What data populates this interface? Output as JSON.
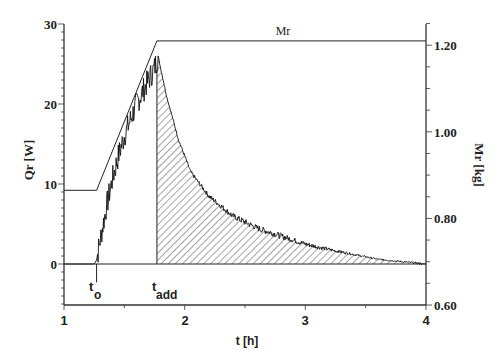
{
  "chart_data": {
    "type": "line",
    "title": "",
    "xlabel": "t [h]",
    "ylabel": "Qr [W]",
    "y2label": "Mr [kg]",
    "xlim": [
      1,
      4
    ],
    "ylim": [
      -5,
      30
    ],
    "y2lim": [
      0.6,
      1.25
    ],
    "x_ticks": [
      "1",
      "2",
      "3",
      "4"
    ],
    "y_ticks": [
      "0",
      "10",
      "20",
      "30"
    ],
    "y2_ticks": [
      "0.60",
      "0.80",
      "1.00",
      "1.20"
    ],
    "grid": false,
    "legend": "none",
    "annotations": [
      {
        "text_main": "t",
        "text_sub": "o",
        "x": 1.27,
        "y": -3.5
      },
      {
        "text_main": "t",
        "text_sub": "add",
        "x": 1.77,
        "y": -3.5
      },
      {
        "text": "Mr",
        "x": 2.75,
        "y2": 1.23
      }
    ],
    "series": [
      {
        "name": "Mr",
        "axis": "right",
        "x": [
          1.0,
          1.27,
          1.77,
          4.0
        ],
        "values": [
          0.865,
          0.865,
          1.21,
          1.21
        ]
      },
      {
        "name": "Qr",
        "axis": "left",
        "x": [
          1.0,
          1.25,
          1.27,
          1.3,
          1.35,
          1.4,
          1.45,
          1.5,
          1.55,
          1.6,
          1.65,
          1.7,
          1.75,
          1.78,
          1.85,
          1.95,
          2.05,
          2.2,
          2.4,
          2.6,
          2.8,
          3.0,
          3.2,
          3.4,
          3.6,
          3.8,
          4.0
        ],
        "values": [
          0,
          0,
          0.5,
          3,
          7,
          10.5,
          13.5,
          16,
          18,
          20,
          21.5,
          23,
          24.5,
          26,
          21,
          15.5,
          11.5,
          8.5,
          6,
          4.5,
          3.5,
          2.5,
          1.8,
          1.2,
          0.6,
          0.3,
          0
        ]
      }
    ],
    "shaded_region": {
      "from_x": 1.77,
      "to_x": 4.0,
      "pattern": "diagonal-hatch",
      "under_series": "Qr"
    }
  },
  "labels": {
    "x_axis_title": "t [h]",
    "y_axis_title": "Qr [W]",
    "y2_axis_title": "Mr [kg]",
    "mr_series_label": "Mr",
    "t_o_main": "t",
    "t_o_sub": "o",
    "t_add_main": "t",
    "t_add_sub": "add"
  },
  "colors": {
    "line": "#222222",
    "axis": "#333333",
    "background": "#ffffff"
  }
}
